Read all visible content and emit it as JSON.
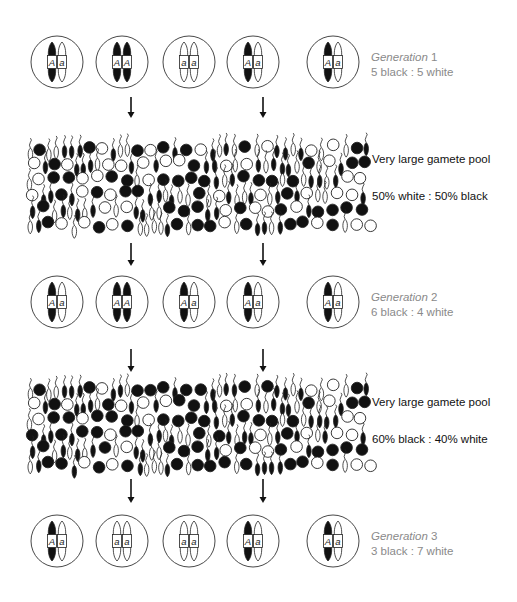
{
  "diagram": {
    "colors": {
      "black_allele": "#111111",
      "white_allele": "#ffffff",
      "outline": "#222222",
      "cell_outline": "#333333",
      "generation_text": "#8a8a8a",
      "pool_text": "#111111"
    },
    "generations": [
      {
        "id": "generation-1",
        "label_word": "Generation",
        "label_number": "1",
        "ratio_text": "5 black : 5 white",
        "cy": 62,
        "individuals": [
          {
            "genotype": "Aa",
            "alleles": [
              "A",
              "a"
            ]
          },
          {
            "genotype": "AA",
            "alleles": [
              "A",
              "A"
            ]
          },
          {
            "genotype": "aa",
            "alleles": [
              "a",
              "a"
            ]
          },
          {
            "genotype": "Aa",
            "alleles": [
              "A",
              "a"
            ]
          },
          {
            "genotype": "Aa",
            "alleles": [
              "A",
              "a"
            ]
          }
        ]
      },
      {
        "id": "generation-2",
        "label_word": "Generation",
        "label_number": "2",
        "ratio_text": "6 black : 4 white",
        "cy": 302,
        "individuals": [
          {
            "genotype": "Aa",
            "alleles": [
              "A",
              "a"
            ]
          },
          {
            "genotype": "AA",
            "alleles": [
              "A",
              "A"
            ]
          },
          {
            "genotype": "Aa",
            "alleles": [
              "A",
              "a"
            ]
          },
          {
            "genotype": "Aa",
            "alleles": [
              "A",
              "a"
            ]
          },
          {
            "genotype": "Aa",
            "alleles": [
              "A",
              "a"
            ]
          }
        ]
      },
      {
        "id": "generation-3",
        "label_word": "Generation",
        "label_number": "3",
        "ratio_text": "3 black : 7 white",
        "cy": 541,
        "individuals": [
          {
            "genotype": "Aa",
            "alleles": [
              "A",
              "a"
            ]
          },
          {
            "genotype": "aa",
            "alleles": [
              "a",
              "a"
            ]
          },
          {
            "genotype": "aa",
            "alleles": [
              "a",
              "a"
            ]
          },
          {
            "genotype": "Aa",
            "alleles": [
              "A",
              "a"
            ]
          },
          {
            "genotype": "Aa",
            "alleles": [
              "A",
              "a"
            ]
          }
        ]
      }
    ],
    "gamete_pools": [
      {
        "id": "gamete-pool-1",
        "title": "Very large gamete pool",
        "ratio_text": "50% white : 50% black",
        "black_fraction": 0.5,
        "top": 140,
        "bottom": 232,
        "seed": 7
      },
      {
        "id": "gamete-pool-2",
        "title": "Very large gamete pool",
        "ratio_text": "60% black : 40% white",
        "black_fraction": 0.6,
        "top": 380,
        "bottom": 472,
        "seed": 7
      }
    ],
    "arrows": [
      {
        "x": 131,
        "y1": 97,
        "y2": 118
      },
      {
        "x": 263,
        "y1": 97,
        "y2": 118
      },
      {
        "x": 131,
        "y1": 243,
        "y2": 266
      },
      {
        "x": 263,
        "y1": 243,
        "y2": 266
      },
      {
        "x": 131,
        "y1": 349,
        "y2": 372
      },
      {
        "x": 263,
        "y1": 349,
        "y2": 372
      },
      {
        "x": 131,
        "y1": 479,
        "y2": 503
      },
      {
        "x": 263,
        "y1": 479,
        "y2": 503
      }
    ],
    "individual_x_positions": [
      57,
      122,
      189,
      253,
      333
    ],
    "cell_radius": 26
  }
}
